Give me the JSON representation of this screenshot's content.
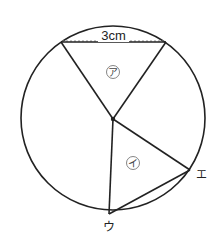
{
  "figure": {
    "type": "geometry",
    "circle": {
      "cx": 113,
      "cy": 118,
      "r": 92
    },
    "center_point": {
      "x": 113,
      "y": 119
    },
    "chord_top": {
      "x1": 61,
      "y1": 42,
      "x2": 166,
      "y2": 42,
      "dimension_label": "3cm"
    },
    "triangle_a": {
      "label": "ア",
      "points": [
        [
          61,
          42
        ],
        [
          166,
          42
        ],
        [
          113,
          119
        ]
      ],
      "label_pos": {
        "x": 113,
        "y": 72
      }
    },
    "triangle_i": {
      "label": "イ",
      "points": [
        [
          113,
          119
        ],
        [
          190,
          170
        ],
        [
          109,
          214
        ]
      ],
      "label_pos": {
        "x": 133,
        "y": 163
      }
    },
    "vertices": [
      {
        "name": "ウ",
        "x": 109,
        "y": 214,
        "label_x": 109,
        "label_y": 228
      },
      {
        "name": "エ",
        "x": 190,
        "y": 170,
        "label_x": 201,
        "label_y": 175
      }
    ],
    "colors": {
      "line": "#222222",
      "dashed": "#8a8a8a",
      "background": "#ffffff"
    }
  }
}
